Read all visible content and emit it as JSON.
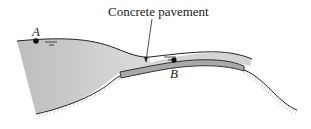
{
  "figure": {
    "callout_label": "Concrete pavement",
    "points": [
      {
        "id": "A",
        "label": "A",
        "description": "point on free water surface of reservoir"
      },
      {
        "id": "B",
        "label": "B",
        "description": "point in flow over concrete pavement"
      }
    ],
    "colors": {
      "water": "#c8c8c8",
      "pavement": "#a9a9a9",
      "outline": "#222222",
      "hatch": "#9a9a9a"
    }
  }
}
